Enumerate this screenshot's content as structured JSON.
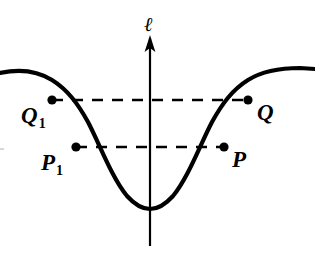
{
  "figure": {
    "background_color": "#ffffff",
    "ink_color": "#000000",
    "axis": {
      "name": "vertical-axis",
      "label": "ℓ",
      "x": 150,
      "top_y": 36,
      "bottom_y": 246,
      "arrow": "up",
      "stroke_width": 2.2
    },
    "curve": {
      "name": "u-shaped-curve",
      "stroke_width": 4.2,
      "vertex": {
        "x": 150,
        "y": 209
      },
      "left_end": {
        "x": 0,
        "y": 73
      },
      "right_end": {
        "x": 315,
        "y": 69
      },
      "path": "M 0,73 C 18,69 36,70 52,80 C 68,90 78,104 88,122 C 100,145 112,178 127,196 C 136,206 143,209 150,209 C 157,209 164,206 173,196 C 188,178 200,145 212,122 C 222,104 232,90 248,80 C 264,70 282,68 300,68 L 315,69"
    },
    "points": [
      {
        "id": "Q1",
        "label": "Q",
        "subscript": "1",
        "x": 52,
        "y": 100,
        "dot_radius": 4.6
      },
      {
        "id": "Q",
        "label": "Q",
        "subscript": "",
        "x": 248,
        "y": 100,
        "dot_radius": 4.6
      },
      {
        "id": "P1",
        "label": "P",
        "subscript": "1",
        "x": 76,
        "y": 147,
        "dot_radius": 4.6
      },
      {
        "id": "P",
        "label": "P",
        "subscript": "",
        "x": 224,
        "y": 147,
        "dot_radius": 4.6
      }
    ],
    "chords": [
      {
        "name": "upper-chord",
        "from": "Q1",
        "to": "Q",
        "x1": 52,
        "x2": 248,
        "y": 100,
        "style": "dashed",
        "dash_pattern": "11 9",
        "stroke_width": 2.4
      },
      {
        "name": "lower-chord",
        "from": "P1",
        "to": "P",
        "x1": 76,
        "x2": 224,
        "y": 147,
        "style": "dashed",
        "dash_pattern": "11 9",
        "stroke_width": 2.4
      }
    ],
    "edge_mark": {
      "name": "left-edge-artifact",
      "color": "#d8d8d8"
    }
  }
}
